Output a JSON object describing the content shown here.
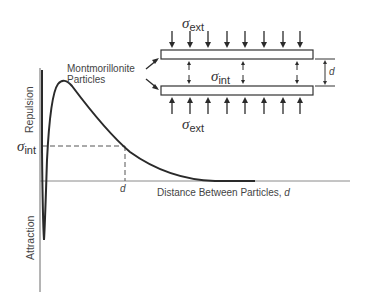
{
  "diagram": {
    "y_axis": {
      "positive_label": "Repulsion",
      "negative_label": "Attraction"
    },
    "x_axis": {
      "label": "Distance Between Particles,",
      "label_variable": "d",
      "tick_label": "d"
    },
    "curve_label_line1": "Montmorillonite",
    "curve_label_line2": "Particles",
    "sigma_int_axis_label": {
      "symbol": "σ",
      "subscript": "int"
    },
    "inset": {
      "sigma_ext_top": {
        "symbol": "σ",
        "subscript": "ext"
      },
      "sigma_ext_bottom": {
        "symbol": "σ",
        "subscript": "ext"
      },
      "sigma_int": {
        "symbol": "σ",
        "subscript": "int"
      },
      "gap_label": "d",
      "plates": 2,
      "external_arrows_per_side": 8,
      "internal_arrow_pairs": 3
    },
    "colors": {
      "line": "#2a2a2a",
      "axis": "#7a7a7a",
      "dashed": "#555555",
      "text": "#444444"
    }
  }
}
